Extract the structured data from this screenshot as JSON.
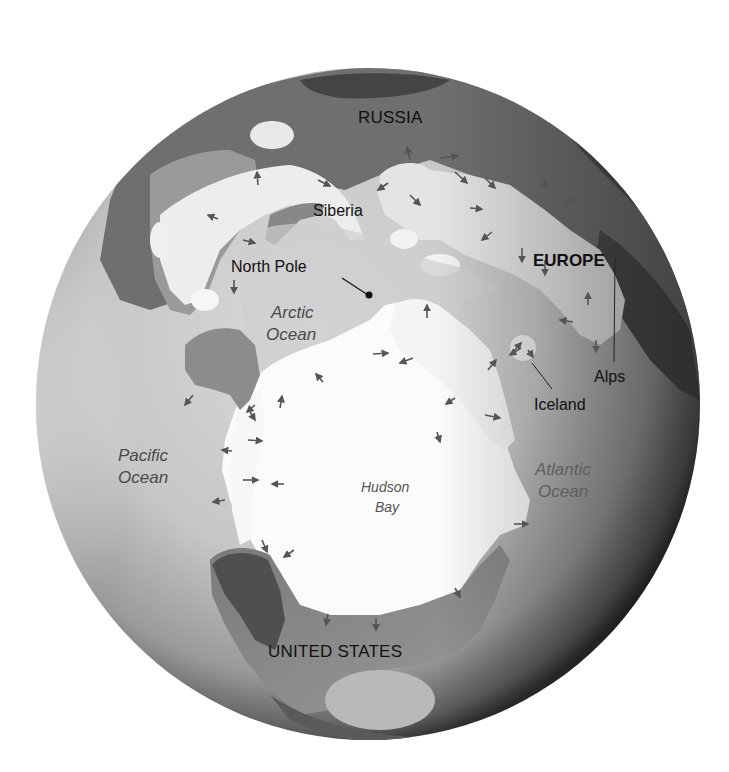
{
  "map": {
    "type": "globe-polar-view",
    "theme": "Ice-age glaciation extent, Northern Hemisphere",
    "colors": {
      "background": "#ffffff",
      "ocean_light": "#d2d2d2",
      "ocean_dark": "#3a3a3a",
      "ice_sheet": "#fbfbfb",
      "ice_sheet_shaded": "#e6e6e6",
      "land": "#8f8f8f",
      "land_dark": "#5a5a5a",
      "label_text": "#111111",
      "ocean_label_text": "#4a4a4a",
      "arrow": "#555555"
    },
    "labels": {
      "russia": "RUSSIA",
      "siberia": "Siberia",
      "north_pole": "North Pole",
      "europe": "EUROPE",
      "arctic_ocean_line1": "Arctic",
      "arctic_ocean_line2": "Ocean",
      "alps": "Alps",
      "iceland": "Iceland",
      "pacific_ocean_line1": "Pacific",
      "pacific_ocean_line2": "Ocean",
      "hudson_bay_line1": "Hudson",
      "hudson_bay_line2": "Bay",
      "atlantic_ocean_line1": "Atlantic",
      "atlantic_ocean_line2": "Ocean",
      "united_states": "UNITED STATES"
    },
    "markers": [
      {
        "name": "north-pole-marker",
        "label_ref": "north_pole"
      }
    ],
    "legend_icons": {
      "ice_flow_arrow": "arrow-icon"
    }
  }
}
